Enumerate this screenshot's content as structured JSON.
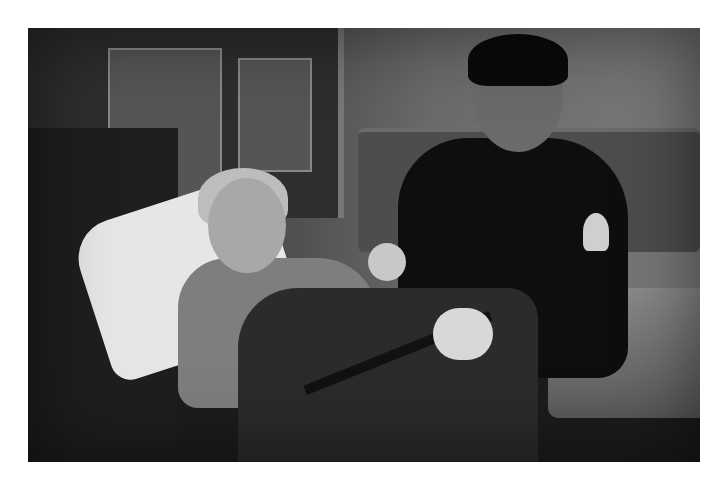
{
  "image": {
    "type": "photograph",
    "style": "black-and-white",
    "description": "Paramedic in dark uniform with patches and latex gloves sitting beside a woman lying on a stretcher inside an ambulance",
    "border_color": "#ffffff",
    "photo_bounds": {
      "x": 28,
      "y": 28,
      "width": 672,
      "height": 434
    }
  }
}
